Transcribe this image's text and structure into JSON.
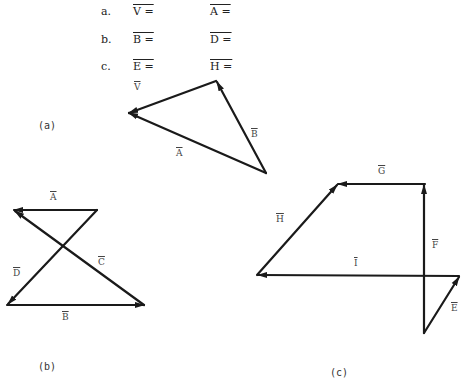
{
  "questions": [
    {
      "letter": "a.",
      "left": "V =",
      "right": "A ="
    },
    {
      "letter": "b.",
      "left": "B =",
      "right": "D ="
    },
    {
      "letter": "c.",
      "left": "E =",
      "right": "H ="
    }
  ],
  "figures": {
    "a": {
      "caption": "(a)",
      "vectors": {
        "V": "V",
        "A": "A",
        "B": "B"
      }
    },
    "b": {
      "caption": "(b)",
      "vectors": {
        "A": "A",
        "B": "B",
        "C": "C",
        "D": "D"
      }
    },
    "c": {
      "caption": "(c)",
      "vectors": {
        "E": "E",
        "F": "F",
        "G": "G",
        "H": "H",
        "I": "I"
      }
    }
  },
  "colors": {
    "stroke": "#1a1a1a",
    "background": "#ffffff"
  }
}
